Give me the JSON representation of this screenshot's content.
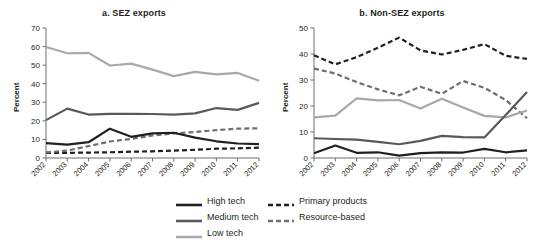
{
  "figure": {
    "ylabel": "Percent",
    "years": [
      "2002",
      "2003",
      "2004",
      "2005",
      "2006",
      "2007",
      "2008",
      "2009",
      "2010",
      "2011",
      "2012"
    ]
  },
  "legend": {
    "items": [
      {
        "label": "High tech",
        "color": "#231f20",
        "style": "solid",
        "width": 2.2
      },
      {
        "label": "Medium tech",
        "color": "#58595b",
        "style": "solid",
        "width": 2.2
      },
      {
        "label": "Low tech",
        "color": "#a7a9ac",
        "style": "solid",
        "width": 2.2
      },
      {
        "label": "Primary products",
        "color": "#231f20",
        "style": "dashed",
        "width": 2.2
      },
      {
        "label": "Resource-based",
        "color": "#6d6e71",
        "style": "dashed",
        "width": 2.2
      }
    ],
    "column_1": [
      "High tech",
      "Medium tech",
      "Low tech"
    ],
    "column_2": [
      "Primary products",
      "Resource-based"
    ]
  },
  "chart_data": [
    {
      "type": "line",
      "title": "a. SEZ exports",
      "xlabel": "",
      "ylabel": "Percent",
      "x": [
        "2002",
        "2003",
        "2004",
        "2005",
        "2006",
        "2007",
        "2008",
        "2009",
        "2010",
        "2011",
        "2012"
      ],
      "ylim": [
        0,
        70
      ],
      "yticks": [
        0,
        10,
        20,
        30,
        40,
        50,
        60,
        70
      ],
      "grid": false,
      "legend_position": "bottom-center",
      "series": [
        {
          "name": "High tech",
          "values": [
            8.0,
            7.2,
            8.5,
            15.8,
            11.4,
            13.3,
            13.6,
            11.0,
            9.0,
            7.8,
            7.5
          ]
        },
        {
          "name": "Medium tech",
          "values": [
            20.4,
            26.6,
            23.4,
            23.8,
            23.8,
            23.7,
            23.4,
            24.0,
            26.9,
            25.9,
            29.7
          ]
        },
        {
          "name": "Low tech",
          "values": [
            59.8,
            56.4,
            56.6,
            49.8,
            50.8,
            47.6,
            44.1,
            46.4,
            45.0,
            45.8,
            41.6
          ]
        },
        {
          "name": "Primary products",
          "values": [
            2.8,
            2.8,
            2.9,
            3.1,
            3.4,
            3.6,
            4.0,
            4.4,
            5.0,
            5.2,
            5.6
          ]
        },
        {
          "name": "Resource-based",
          "values": [
            3.0,
            4.0,
            6.4,
            8.9,
            10.3,
            12.1,
            13.2,
            14.0,
            15.0,
            15.8,
            16.0
          ]
        }
      ]
    },
    {
      "type": "line",
      "title": "b. Non-SEZ exports",
      "xlabel": "",
      "ylabel": "Percent",
      "x": [
        "2002",
        "2003",
        "2004",
        "2005",
        "2006",
        "2007",
        "2008",
        "2009",
        "2010",
        "2011",
        "2012"
      ],
      "ylim": [
        0,
        50
      ],
      "yticks": [
        0,
        10,
        20,
        30,
        40,
        50
      ],
      "grid": false,
      "legend_position": "bottom-center",
      "series": [
        {
          "name": "High tech",
          "values": [
            1.8,
            4.8,
            2.0,
            2.2,
            0.9,
            1.9,
            2.2,
            2.1,
            3.5,
            2.2,
            2.9
          ]
        },
        {
          "name": "Medium tech",
          "values": [
            7.6,
            7.3,
            7.1,
            6.2,
            5.3,
            6.6,
            8.5,
            8.0,
            7.9,
            16.5,
            25.4
          ]
        },
        {
          "name": "Low tech",
          "values": [
            15.6,
            16.3,
            22.9,
            22.2,
            22.3,
            19.0,
            22.8,
            19.4,
            16.2,
            15.6,
            18.3
          ]
        },
        {
          "name": "Primary products",
          "values": [
            39.5,
            36.0,
            38.8,
            42.4,
            46.3,
            41.4,
            39.8,
            41.6,
            43.8,
            39.3,
            38.1
          ]
        },
        {
          "name": "Resource-based",
          "values": [
            34.4,
            32.5,
            29.2,
            26.4,
            24.1,
            27.4,
            24.7,
            29.6,
            27.0,
            22.3,
            15.3
          ]
        }
      ]
    }
  ]
}
